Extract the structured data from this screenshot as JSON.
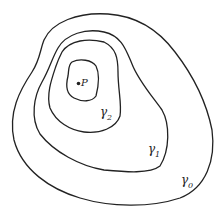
{
  "diagram": {
    "point": {
      "label": "P"
    },
    "curves": [
      {
        "id": "gamma0",
        "symbol": "γ",
        "subscript": "0"
      },
      {
        "id": "gamma1",
        "symbol": "γ",
        "subscript": "1"
      },
      {
        "id": "gamma2",
        "symbol": "γ",
        "subscript": "2"
      }
    ],
    "colors": {
      "stroke": "#222222",
      "background": "#ffffff"
    }
  }
}
